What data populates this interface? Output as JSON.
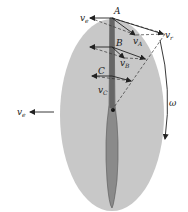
{
  "diagram": {
    "colors": {
      "disc": "#c8c8c8",
      "blade": "#8a8a8a",
      "blade_edge": "#555555",
      "vector": "#222222",
      "dashed": "#333333",
      "background": "#ffffff"
    },
    "points": [
      {
        "name": "A",
        "label": "A"
      },
      {
        "name": "B",
        "label": "B"
      },
      {
        "name": "C",
        "label": "C"
      }
    ],
    "vectors": {
      "ve_top": {
        "main": "v",
        "sub": "e"
      },
      "vr": {
        "main": "v",
        "sub": "r"
      },
      "vA": {
        "main": "v",
        "sub": "A"
      },
      "vB": {
        "main": "v",
        "sub": "B"
      },
      "vC": {
        "main": "v",
        "sub": "C"
      },
      "ve_left": {
        "main": "v",
        "sub": "e"
      }
    },
    "rotation": {
      "label": "ω"
    }
  }
}
